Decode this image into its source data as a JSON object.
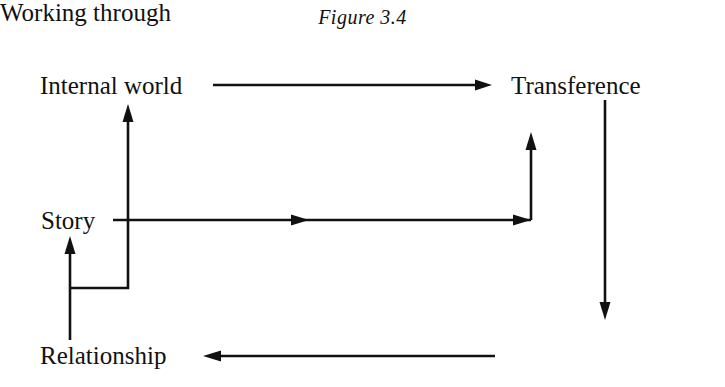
{
  "figure": {
    "title": "Figure 3.4",
    "background_color": "#ffffff",
    "ink_color": "#111111",
    "width": 725,
    "height": 387
  },
  "nodes": [
    {
      "id": "internal-world",
      "label": "Internal world",
      "x": 40,
      "y": 73
    },
    {
      "id": "transference",
      "label": "Transference",
      "x": 511,
      "y": 73
    },
    {
      "id": "story",
      "label": "Story",
      "x": 41,
      "y": 208
    },
    {
      "id": "relationship",
      "label": "Relationship",
      "x": 40,
      "y": 343
    },
    {
      "id": "working-through",
      "label": "Working through",
      "x": 511,
      "y": 343
    }
  ],
  "edges": [
    {
      "id": "internal-world-to-transference",
      "from": "internal-world",
      "to": "transference",
      "direction": "right",
      "icon": "arrow-right-icon"
    },
    {
      "id": "transference-to-working-through",
      "from": "transference",
      "to": "working-through",
      "direction": "down",
      "icon": "arrow-down-icon"
    },
    {
      "id": "working-through-to-relationship",
      "from": "working-through",
      "to": "relationship",
      "direction": "left",
      "icon": "arrow-left-icon"
    },
    {
      "id": "relationship-to-story",
      "from": "relationship",
      "to": "story",
      "direction": "up",
      "icon": "arrow-up-icon"
    },
    {
      "id": "relationship-to-internal-world",
      "from": "relationship",
      "to": "internal-world",
      "direction": "up",
      "icon": "arrow-up-icon"
    },
    {
      "id": "story-to-transference",
      "from": "story",
      "to": "transference",
      "direction": "right-then-up",
      "icon": "arrow-right-up-icon"
    }
  ]
}
